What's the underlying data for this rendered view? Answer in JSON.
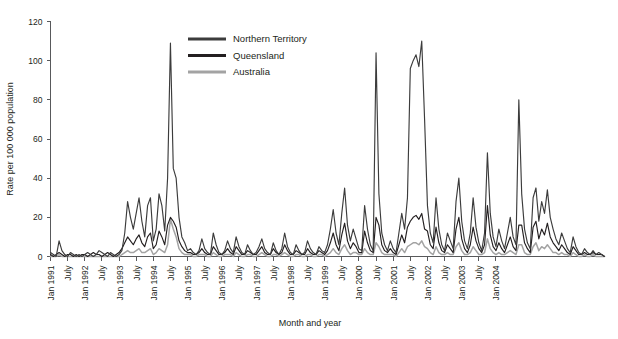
{
  "chart_data": {
    "type": "line",
    "title": "",
    "xlabel": "Month and year",
    "ylabel": "Rate per 100 000 population",
    "ylim": [
      0,
      120
    ],
    "yticks": [
      0,
      20,
      40,
      60,
      80,
      100,
      120
    ],
    "grid": false,
    "legend_position": "top-center",
    "x_start": "Jan 1991",
    "x_end": "Jul 2004",
    "x_tick_interval_months": 6,
    "x_tick_labels": [
      "Jan 1991",
      "July",
      "Jan 1992",
      "July",
      "Jan 1993",
      "July",
      "Jan 1994",
      "July",
      "Jan 1995",
      "July",
      "Jan 1996",
      "July",
      "Jan 1997",
      "July",
      "Jan 1998",
      "July",
      "Jan 1999",
      "July",
      "Jan 2000",
      "July",
      "Jan 2001",
      "July",
      "Jan 2002",
      "July",
      "Jan 2003",
      "July",
      "Jan 2004"
    ],
    "colors": {
      "northern_territory": "#3c3c3c",
      "queensland": "#231f20",
      "australia": "#a3a3a3"
    },
    "series": [
      {
        "name": "Northern Territory",
        "color": "#3c3c3c",
        "values": [
          2,
          1,
          0,
          8,
          3,
          1,
          0,
          2,
          1,
          0,
          1,
          0,
          1,
          2,
          1,
          0,
          1,
          3,
          2,
          1,
          0,
          2,
          1,
          0,
          1,
          3,
          12,
          28,
          20,
          14,
          22,
          30,
          18,
          10,
          26,
          30,
          8,
          14,
          32,
          26,
          13,
          40,
          109,
          45,
          40,
          20,
          10,
          7,
          3,
          4,
          2,
          1,
          3,
          9,
          4,
          2,
          1,
          12,
          6,
          2,
          1,
          3,
          8,
          4,
          2,
          10,
          5,
          2,
          1,
          6,
          3,
          1,
          2,
          5,
          9,
          4,
          2,
          1,
          7,
          3,
          1,
          4,
          12,
          5,
          2,
          1,
          6,
          3,
          1,
          2,
          8,
          4,
          2,
          1,
          5,
          3,
          2,
          6,
          14,
          24,
          12,
          6,
          22,
          35,
          16,
          8,
          14,
          9,
          4,
          3,
          26,
          14,
          6,
          3,
          104,
          32,
          12,
          6,
          3,
          8,
          4,
          2,
          12,
          22,
          14,
          30,
          96,
          100,
          103,
          97,
          110,
          70,
          26,
          12,
          7,
          30,
          14,
          6,
          3,
          12,
          8,
          4,
          28,
          40,
          18,
          8,
          4,
          12,
          30,
          15,
          7,
          3,
          12,
          53,
          22,
          10,
          5,
          14,
          8,
          4,
          12,
          20,
          10,
          6,
          80,
          32,
          14,
          7,
          4,
          30,
          35,
          18,
          28,
          22,
          34,
          20,
          14,
          9,
          6,
          12,
          8,
          4,
          2,
          10,
          5,
          2,
          1,
          4,
          2,
          1,
          3,
          1,
          2,
          1,
          0
        ]
      },
      {
        "name": "Queensland",
        "color": "#231f20",
        "values": [
          1,
          0,
          1,
          2,
          1,
          0,
          1,
          1,
          0,
          1,
          0,
          1,
          1,
          0,
          1,
          2,
          1,
          1,
          0,
          1,
          2,
          1,
          0,
          1,
          2,
          4,
          7,
          10,
          8,
          6,
          9,
          11,
          7,
          5,
          10,
          12,
          4,
          6,
          13,
          10,
          6,
          16,
          20,
          18,
          15,
          8,
          5,
          3,
          2,
          2,
          1,
          1,
          2,
          4,
          2,
          1,
          1,
          5,
          3,
          1,
          1,
          2,
          4,
          2,
          1,
          5,
          3,
          1,
          1,
          3,
          2,
          1,
          1,
          3,
          5,
          2,
          1,
          1,
          4,
          2,
          1,
          2,
          6,
          3,
          1,
          1,
          3,
          2,
          1,
          1,
          4,
          2,
          1,
          1,
          3,
          2,
          1,
          3,
          7,
          12,
          6,
          3,
          11,
          17,
          8,
          4,
          7,
          5,
          2,
          2,
          13,
          7,
          3,
          2,
          20,
          16,
          6,
          3,
          2,
          4,
          2,
          1,
          6,
          11,
          7,
          15,
          18,
          20,
          21,
          19,
          22,
          14,
          13,
          6,
          4,
          15,
          7,
          3,
          2,
          6,
          4,
          2,
          14,
          20,
          9,
          4,
          2,
          6,
          15,
          8,
          4,
          2,
          6,
          26,
          11,
          5,
          3,
          7,
          4,
          2,
          6,
          10,
          5,
          3,
          16,
          16,
          7,
          4,
          2,
          15,
          18,
          9,
          14,
          11,
          17,
          10,
          7,
          5,
          3,
          6,
          4,
          2,
          1,
          5,
          3,
          1,
          1,
          2,
          1,
          1,
          2,
          1,
          1,
          1,
          0
        ]
      },
      {
        "name": "Australia",
        "color": "#a3a3a3",
        "values": [
          0,
          0,
          0,
          1,
          0,
          0,
          0,
          0,
          0,
          0,
          0,
          0,
          0,
          0,
          0,
          0,
          0,
          0,
          0,
          0,
          0,
          0,
          0,
          0,
          0,
          1,
          2,
          3,
          2,
          2,
          3,
          4,
          2,
          2,
          3,
          4,
          1,
          2,
          4,
          3,
          2,
          6,
          19,
          14,
          10,
          4,
          2,
          1,
          1,
          1,
          0,
          0,
          1,
          1,
          1,
          0,
          0,
          2,
          1,
          0,
          0,
          1,
          1,
          1,
          0,
          2,
          1,
          0,
          0,
          1,
          1,
          0,
          0,
          1,
          2,
          1,
          0,
          0,
          1,
          1,
          0,
          1,
          2,
          1,
          0,
          0,
          1,
          1,
          0,
          0,
          1,
          1,
          0,
          0,
          1,
          1,
          0,
          1,
          2,
          4,
          2,
          1,
          4,
          6,
          3,
          1,
          2,
          2,
          1,
          1,
          4,
          2,
          1,
          1,
          7,
          5,
          2,
          1,
          1,
          1,
          1,
          0,
          2,
          4,
          2,
          5,
          6,
          7,
          7,
          6,
          8,
          5,
          4,
          2,
          1,
          5,
          2,
          1,
          1,
          2,
          1,
          1,
          5,
          7,
          3,
          1,
          1,
          2,
          5,
          3,
          1,
          1,
          2,
          9,
          4,
          2,
          1,
          2,
          1,
          1,
          2,
          3,
          2,
          1,
          6,
          6,
          2,
          1,
          1,
          5,
          7,
          3,
          5,
          4,
          6,
          4,
          2,
          2,
          1,
          2,
          1,
          1,
          0,
          2,
          1,
          0,
          0,
          1,
          0,
          0,
          1,
          0,
          0,
          0,
          0
        ]
      }
    ]
  },
  "legend": {
    "items": [
      {
        "label": "Northern Territory"
      },
      {
        "label": "Queensland"
      },
      {
        "label": "Australia"
      }
    ]
  },
  "axes": {
    "y_title": "Rate per 100 000 population",
    "x_title": "Month and year"
  }
}
